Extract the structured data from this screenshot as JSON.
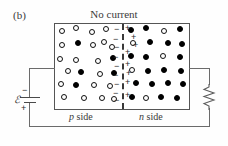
{
  "figure": {
    "panel_label": "(b)",
    "title": "No current",
    "caption": "Reverse bias",
    "region_labels": {
      "p_side_italic": "p",
      "p_side_text": " side",
      "n_side_italic": "n",
      "n_side_text": " side"
    }
  },
  "circuit": {
    "emf_symbol": "ℰ",
    "battery_negative": "−",
    "battery_positive": "+",
    "resistor_name": "resistor-zigzag"
  },
  "colors": {
    "box_border": "#555555",
    "junction_dashes": "#3a3a3a",
    "wire": "#6b6b6b",
    "carrier_filled": "#000000",
    "carrier_open_border": "#111111",
    "text": "#2a2a2a",
    "background": "#fefefe"
  },
  "diagram_data": {
    "type": "diagram",
    "description": "p-n junction diode under reverse bias showing no current",
    "box": {
      "x": 54,
      "y": 23,
      "w": 136,
      "h": 87
    },
    "junction_x": 122,
    "p_side_carriers": [
      {
        "x": 62,
        "y": 31,
        "type": "open"
      },
      {
        "x": 76,
        "y": 28,
        "type": "open"
      },
      {
        "x": 92,
        "y": 32,
        "type": "open"
      },
      {
        "x": 106,
        "y": 29,
        "type": "open"
      },
      {
        "x": 62,
        "y": 45,
        "type": "open"
      },
      {
        "x": 78,
        "y": 43,
        "type": "filled"
      },
      {
        "x": 93,
        "y": 45,
        "type": "open"
      },
      {
        "x": 104,
        "y": 42,
        "type": "open"
      },
      {
        "x": 112,
        "y": 47,
        "type": "open"
      },
      {
        "x": 60,
        "y": 59,
        "type": "open"
      },
      {
        "x": 76,
        "y": 60,
        "type": "open"
      },
      {
        "x": 98,
        "y": 61,
        "type": "open"
      },
      {
        "x": 113,
        "y": 58,
        "type": "filled"
      },
      {
        "x": 68,
        "y": 71,
        "type": "open"
      },
      {
        "x": 81,
        "y": 72,
        "type": "filled"
      },
      {
        "x": 100,
        "y": 74,
        "type": "open"
      },
      {
        "x": 114,
        "y": 73,
        "type": "filled"
      },
      {
        "x": 61,
        "y": 84,
        "type": "open"
      },
      {
        "x": 76,
        "y": 85,
        "type": "filled"
      },
      {
        "x": 94,
        "y": 85,
        "type": "open"
      },
      {
        "x": 110,
        "y": 86,
        "type": "open"
      },
      {
        "x": 64,
        "y": 97,
        "type": "open"
      },
      {
        "x": 84,
        "y": 98,
        "type": "open"
      },
      {
        "x": 102,
        "y": 98,
        "type": "open"
      },
      {
        "x": 114,
        "y": 99,
        "type": "open"
      }
    ],
    "n_side_carriers": [
      {
        "x": 131,
        "y": 30,
        "type": "filled"
      },
      {
        "x": 146,
        "y": 28,
        "type": "filled"
      },
      {
        "x": 164,
        "y": 31,
        "type": "open"
      },
      {
        "x": 180,
        "y": 29,
        "type": "filled"
      },
      {
        "x": 133,
        "y": 43,
        "type": "open"
      },
      {
        "x": 150,
        "y": 42,
        "type": "filled"
      },
      {
        "x": 168,
        "y": 43,
        "type": "filled"
      },
      {
        "x": 182,
        "y": 44,
        "type": "filled"
      },
      {
        "x": 131,
        "y": 56,
        "type": "filled"
      },
      {
        "x": 146,
        "y": 57,
        "type": "filled"
      },
      {
        "x": 163,
        "y": 56,
        "type": "open"
      },
      {
        "x": 180,
        "y": 57,
        "type": "filled"
      },
      {
        "x": 132,
        "y": 70,
        "type": "open"
      },
      {
        "x": 148,
        "y": 71,
        "type": "filled"
      },
      {
        "x": 164,
        "y": 70,
        "type": "filled"
      },
      {
        "x": 181,
        "y": 71,
        "type": "filled"
      },
      {
        "x": 136,
        "y": 83,
        "type": "filled"
      },
      {
        "x": 152,
        "y": 84,
        "type": "filled"
      },
      {
        "x": 168,
        "y": 83,
        "type": "filled"
      },
      {
        "x": 183,
        "y": 84,
        "type": "filled"
      },
      {
        "x": 132,
        "y": 97,
        "type": "filled"
      },
      {
        "x": 146,
        "y": 98,
        "type": "open"
      },
      {
        "x": 161,
        "y": 97,
        "type": "filled"
      },
      {
        "x": 177,
        "y": 98,
        "type": "filled"
      }
    ],
    "depletion_minus_signs": [
      {
        "x": 114,
        "y": 29
      },
      {
        "x": 113,
        "y": 39
      },
      {
        "x": 114,
        "y": 47
      },
      {
        "x": 113,
        "y": 57
      },
      {
        "x": 114,
        "y": 66
      },
      {
        "x": 113,
        "y": 75
      },
      {
        "x": 114,
        "y": 84
      },
      {
        "x": 113,
        "y": 93
      },
      {
        "x": 114,
        "y": 100
      }
    ],
    "depletion_plus_signs": [
      {
        "x": 125,
        "y": 28
      },
      {
        "x": 131,
        "y": 37
      },
      {
        "x": 133,
        "y": 45
      },
      {
        "x": 125,
        "y": 52
      },
      {
        "x": 125,
        "y": 64
      },
      {
        "x": 126,
        "y": 73
      },
      {
        "x": 125,
        "y": 82
      },
      {
        "x": 125,
        "y": 95
      }
    ]
  }
}
